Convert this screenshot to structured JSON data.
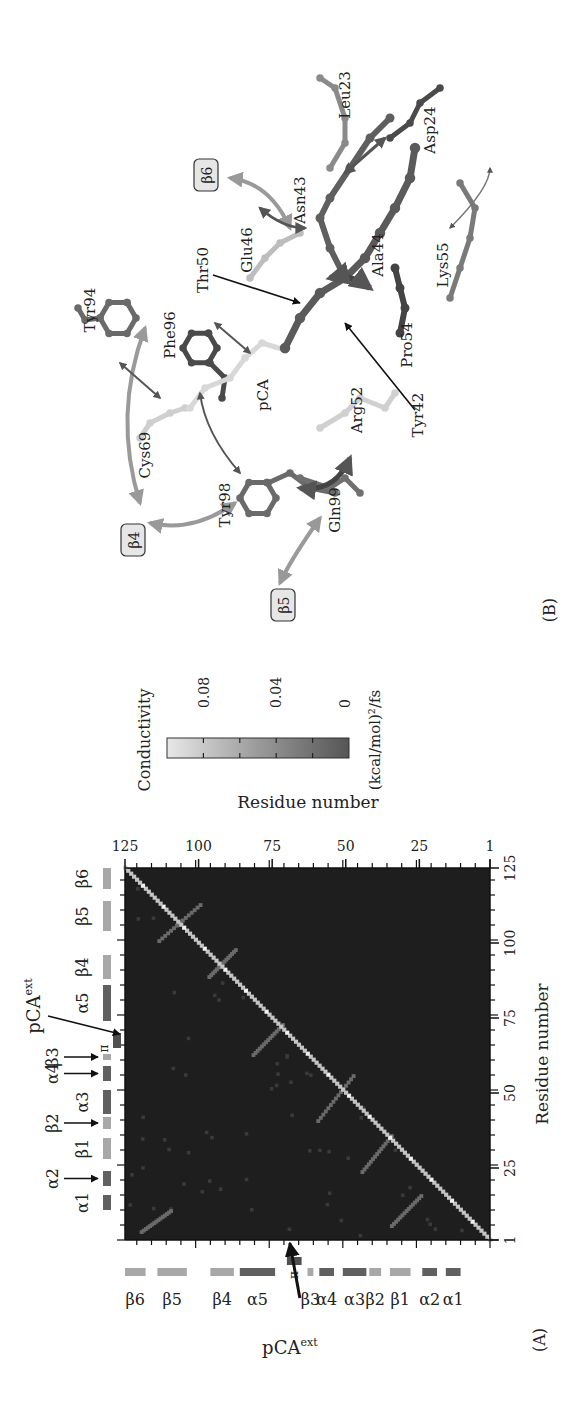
{
  "panels": {
    "a_label": "(A)",
    "b_label": "(B)"
  },
  "chart_data": {
    "type": "heatmap",
    "title": "",
    "xlabel": "Residue number",
    "ylabel": "Residue number",
    "x_ticks": [
      "1",
      "25",
      "50",
      "75",
      "100",
      "125"
    ],
    "y_ticks": [
      "1",
      "25",
      "50",
      "75",
      "100",
      "125"
    ],
    "xlim": [
      1,
      125
    ],
    "ylim": [
      1,
      125
    ],
    "colorbar": {
      "label": "Conductivity",
      "unit": "(kcal/mol)²/fs",
      "ticks": [
        "0.08",
        "0.04",
        "0"
      ],
      "range": [
        0,
        0.1
      ],
      "color_low": "#555555",
      "color_high": "#e8e8e8"
    },
    "background_color": "#1e1e1e",
    "diagonal": "bright line from residue 1 to 125 (self/neighbor conductivity ≈0.08–0.1)",
    "off_diagonal_features": [
      {
        "x": [
          100,
          112
        ],
        "y": [
          114,
          100
        ],
        "desc": "β5–β6 sheet contacts"
      },
      {
        "x": [
          88,
          97
        ],
        "y": [
          97,
          88
        ],
        "desc": "β4–β5 hairpin"
      },
      {
        "x": [
          62,
          72
        ],
        "y": [
          82,
          72
        ],
        "desc": "α5 region / pCA contacts"
      },
      {
        "x": [
          40,
          55
        ],
        "y": [
          60,
          48
        ],
        "desc": "α3/α4 – pCA pocket contacts"
      },
      {
        "x": [
          23,
          35
        ],
        "y": [
          45,
          35
        ],
        "desc": "β1–β2 contacts"
      },
      {
        "x": [
          5,
          15
        ],
        "y": [
          35,
          25
        ],
        "desc": "α1/α2 – β1 contacts"
      },
      {
        "x": [
          3,
          10
        ],
        "y": [
          120,
          110
        ],
        "desc": "N-term – β6"
      }
    ],
    "secondary_structure": [
      {
        "label": "α1",
        "start": 11,
        "end": 16,
        "shade": "#606060"
      },
      {
        "label": "α2",
        "start": 19,
        "end": 24,
        "shade": "#606060"
      },
      {
        "label": "β1",
        "start": 28,
        "end": 35,
        "shade": "#a8a8a8"
      },
      {
        "label": "β2",
        "start": 38,
        "end": 42,
        "shade": "#a8a8a8"
      },
      {
        "label": "α3",
        "start": 43,
        "end": 51,
        "shade": "#606060"
      },
      {
        "label": "α4",
        "start": 54,
        "end": 59,
        "shade": "#606060"
      },
      {
        "label": "β3",
        "start": 61,
        "end": 63,
        "shade": "#a8a8a8"
      },
      {
        "label": "π",
        "start": 65,
        "end": 70,
        "shade": "#505050"
      },
      {
        "label": "α5",
        "start": 74,
        "end": 86,
        "shade": "#606060"
      },
      {
        "label": "β4",
        "start": 88,
        "end": 96,
        "shade": "#a8a8a8"
      },
      {
        "label": "β5",
        "start": 104,
        "end": 114,
        "shade": "#a8a8a8"
      },
      {
        "label": "β6",
        "start": 118,
        "end": 125,
        "shade": "#a8a8a8"
      }
    ],
    "annotations": [
      "pCA^ext (arrow at residue ≈69)"
    ]
  },
  "heatmap_labels": {
    "top_ss": [
      {
        "text": "α1",
        "res": 13.5
      },
      {
        "text": "α2",
        "res": 21.5,
        "arrow": true
      },
      {
        "text": "β1",
        "res": 31.5
      },
      {
        "text": "β2",
        "res": 40,
        "arrow": true
      },
      {
        "text": "α3",
        "res": 47
      },
      {
        "text": "α4",
        "res": 56.5,
        "arrow": true
      },
      {
        "text": "β3",
        "res": 62,
        "arrow": true
      },
      {
        "text": "π",
        "res": 67.5
      },
      {
        "text": "α5",
        "res": 80
      },
      {
        "text": "β4",
        "res": 92
      },
      {
        "text": "β5",
        "res": 109
      },
      {
        "text": "β6",
        "res": 121.5
      }
    ],
    "pca_ext": "pCA",
    "pca_ext_sup": "ext"
  },
  "structure": {
    "residues": [
      {
        "name": "Tyr94",
        "x": 1098,
        "y": 95
      },
      {
        "name": "Phe96",
        "x": 1073,
        "y": 175
      },
      {
        "name": "Cys69",
        "x": 953,
        "y": 150
      },
      {
        "name": "Tyr98",
        "x": 903,
        "y": 230
      },
      {
        "name": "Gln99",
        "x": 898,
        "y": 340
      },
      {
        "name": "pCA",
        "x": 1013,
        "y": 268
      },
      {
        "name": "Arg52",
        "x": 998,
        "y": 362
      },
      {
        "name": "Pro54",
        "x": 1063,
        "y": 412
      },
      {
        "name": "Tyr42",
        "x": 993,
        "y": 423
      },
      {
        "name": "Thr50",
        "x": 1138,
        "y": 208
      },
      {
        "name": "Glu46",
        "x": 1158,
        "y": 252
      },
      {
        "name": "Ala44",
        "x": 1153,
        "y": 383
      },
      {
        "name": "Lys55",
        "x": 1143,
        "y": 448
      },
      {
        "name": "Asn43",
        "x": 1208,
        "y": 305
      },
      {
        "name": "Leu23",
        "x": 1313,
        "y": 350
      },
      {
        "name": "Asp24",
        "x": 1278,
        "y": 435
      }
    ],
    "ss_boxes": [
      {
        "label": "β4",
        "x": 868,
        "y": 135
      },
      {
        "label": "β5",
        "x": 803,
        "y": 285
      },
      {
        "label": "β6",
        "x": 1233,
        "y": 208
      }
    ]
  }
}
